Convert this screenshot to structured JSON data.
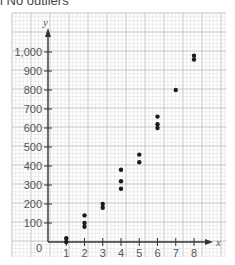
{
  "caption": "i No outliers",
  "chart_data": {
    "type": "scatter",
    "title": "No outliers",
    "xlabel": "x",
    "ylabel": "y",
    "xlim": [
      0,
      8
    ],
    "ylim": [
      0,
      1000
    ],
    "x_ticks": [
      "1",
      "2",
      "3",
      "4",
      "5",
      "6",
      "7",
      "8"
    ],
    "y_ticks": [
      "100",
      "200",
      "300",
      "400",
      "500",
      "600",
      "700",
      "800",
      "900",
      "1,000"
    ],
    "origin_label": "0",
    "grid": true,
    "points": [
      {
        "x": 1,
        "y": 20
      },
      {
        "x": 1,
        "y": 0
      },
      {
        "x": 2,
        "y": 140
      },
      {
        "x": 2,
        "y": 100
      },
      {
        "x": 2,
        "y": 80
      },
      {
        "x": 3,
        "y": 200
      },
      {
        "x": 3,
        "y": 180
      },
      {
        "x": 4,
        "y": 380
      },
      {
        "x": 4,
        "y": 320
      },
      {
        "x": 4,
        "y": 280
      },
      {
        "x": 5,
        "y": 460
      },
      {
        "x": 5,
        "y": 420
      },
      {
        "x": 6,
        "y": 660
      },
      {
        "x": 6,
        "y": 620
      },
      {
        "x": 6,
        "y": 600
      },
      {
        "x": 7,
        "y": 800
      },
      {
        "x": 8,
        "y": 980
      },
      {
        "x": 8,
        "y": 960
      }
    ]
  },
  "colors": {
    "grid_minor": "#dcdcdc",
    "grid_major": "#b8b8b8",
    "axis": "#333333",
    "point": "#1a1a1a",
    "label": "#555555"
  }
}
